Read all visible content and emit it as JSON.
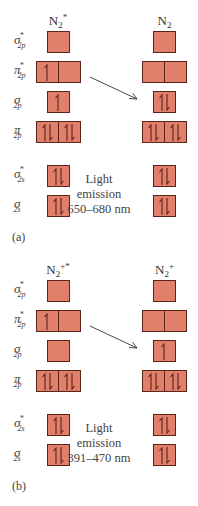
{
  "colors": {
    "box_fill": "#e0806a",
    "box_border": "#5a2418",
    "electron": "#5a2418",
    "arrow": "#333333"
  },
  "row_labels": [
    {
      "base": "σ",
      "sub": "2p",
      "star": "*"
    },
    {
      "base": "π",
      "sub": "2p",
      "star": "*"
    },
    {
      "base": "σ",
      "sub": "2p",
      "star": ""
    },
    {
      "base": "π",
      "sub": "2p",
      "star": ""
    },
    {
      "base": "σ",
      "sub": "2s",
      "star": "*"
    },
    {
      "base": "σ",
      "sub": "2s",
      "star": ""
    }
  ],
  "panels": [
    {
      "caption": "(a)",
      "left_header": {
        "base": "N",
        "sub": "2",
        "sup": "*"
      },
      "right_header": {
        "base": "N",
        "sub": "2",
        "sup": ""
      },
      "emission": {
        "line1": "Light",
        "line2": "emission",
        "line3": "650–680 nm"
      },
      "left_occupancy": [
        [
          "empty"
        ],
        [
          "up",
          "empty"
        ],
        [
          "up"
        ],
        [
          "pair",
          "pair"
        ],
        [
          "pair"
        ],
        [
          "pair"
        ]
      ],
      "right_occupancy": [
        [
          "empty"
        ],
        [
          "empty",
          "empty"
        ],
        [
          "pair"
        ],
        [
          "pair",
          "pair"
        ],
        [
          "pair"
        ],
        [
          "pair"
        ]
      ]
    },
    {
      "caption": "(b)",
      "left_header": {
        "base": "N",
        "sub": "2",
        "sup": "+*"
      },
      "right_header": {
        "base": "N",
        "sub": "2",
        "sup": "+"
      },
      "emission": {
        "line1": "Light",
        "line2": "emission",
        "line3": "391–470 nm"
      },
      "left_occupancy": [
        [
          "empty"
        ],
        [
          "up",
          "empty"
        ],
        [
          "empty"
        ],
        [
          "pair",
          "pair"
        ],
        [
          "pair"
        ],
        [
          "pair"
        ]
      ],
      "right_occupancy": [
        [
          "empty"
        ],
        [
          "empty",
          "empty"
        ],
        [
          "up"
        ],
        [
          "pair",
          "pair"
        ],
        [
          "pair"
        ],
        [
          "pair"
        ]
      ]
    }
  ]
}
